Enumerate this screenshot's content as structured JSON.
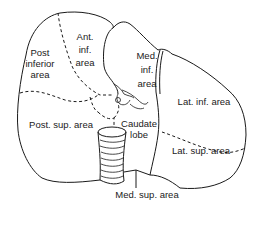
{
  "diagram": {
    "colors": {
      "line": "#1a1a1a",
      "background": "#ffffff"
    },
    "labels": {
      "post_inferior": [
        "Post",
        "inferior",
        "area"
      ],
      "ant_inf": [
        "Ant.",
        "inf.",
        "area"
      ],
      "med_inf": [
        "Med.",
        "inf.",
        "area"
      ],
      "lat_inf": "Lat. inf. area",
      "post_sup": "Post. sup. area",
      "caudate": [
        "Caudate",
        "lobe"
      ],
      "lat_sup": "Lat. sup. area",
      "med_sup": "Med. sup. area"
    }
  }
}
